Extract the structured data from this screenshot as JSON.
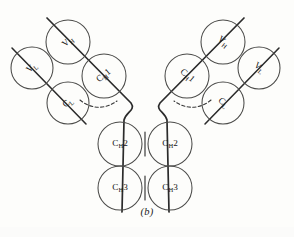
{
  "figure": {
    "caption": "(b)",
    "background_color": "#fdfdfb",
    "stroke_color": "#4a4a48",
    "chain_color": "#2b2b2b",
    "label_color": "#161616",
    "domains": [
      {
        "id": "left-vh",
        "name": "V_H",
        "base": "V",
        "sub": "H",
        "suffix": "",
        "cx": 68,
        "cy": 42,
        "r": 22,
        "rotation": -40,
        "arm": "left"
      },
      {
        "id": "left-vl",
        "name": "V_L",
        "base": "V",
        "sub": "L",
        "suffix": "",
        "cx": 32,
        "cy": 68,
        "r": 21,
        "rotation": -40,
        "arm": "left"
      },
      {
        "id": "left-ch1",
        "name": "C_H1",
        "base": "C",
        "sub": "H",
        "suffix": "1",
        "cx": 104,
        "cy": 76,
        "r": 22,
        "rotation": -40,
        "arm": "left"
      },
      {
        "id": "left-cl",
        "name": "C_L",
        "base": "C",
        "sub": "L",
        "suffix": "",
        "cx": 68,
        "cy": 103,
        "r": 21,
        "rotation": -40,
        "arm": "left"
      },
      {
        "id": "right-vh",
        "name": "V_H",
        "base": "V",
        "sub": "H",
        "suffix": "",
        "cx": 223,
        "cy": 42,
        "r": 22,
        "rotation": 40,
        "arm": "right"
      },
      {
        "id": "right-vl",
        "name": "V_L",
        "base": "V",
        "sub": "L",
        "suffix": "",
        "cx": 259,
        "cy": 68,
        "r": 21,
        "rotation": 40,
        "arm": "right"
      },
      {
        "id": "right-ch1",
        "name": "C_H1",
        "base": "C",
        "sub": "H",
        "suffix": "1",
        "cx": 187,
        "cy": 76,
        "r": 22,
        "rotation": 40,
        "arm": "right"
      },
      {
        "id": "right-cl",
        "name": "C_L",
        "base": "C",
        "sub": "L",
        "suffix": "",
        "cx": 223,
        "cy": 103,
        "r": 21,
        "rotation": 40,
        "arm": "right"
      },
      {
        "id": "left-ch2",
        "name": "C_H2",
        "base": "C",
        "sub": "H",
        "suffix": "2",
        "cx": 120,
        "cy": 144,
        "r": 22,
        "rotation": 0,
        "arm": "stem-left"
      },
      {
        "id": "right-ch2",
        "name": "C_H2",
        "base": "C",
        "sub": "H",
        "suffix": "2",
        "cx": 170,
        "cy": 144,
        "r": 22,
        "rotation": 0,
        "arm": "stem-right"
      },
      {
        "id": "left-ch3",
        "name": "C_H3",
        "base": "C",
        "sub": "H",
        "suffix": "3",
        "cx": 120,
        "cy": 188,
        "r": 22,
        "rotation": 0,
        "arm": "stem-left"
      },
      {
        "id": "right-ch3",
        "name": "C_H3",
        "base": "C",
        "sub": "H",
        "suffix": "3",
        "cx": 170,
        "cy": 188,
        "r": 22,
        "rotation": 0,
        "arm": "stem-right"
      }
    ],
    "heavy_chains": [
      {
        "id": "heavy-left",
        "path": "M 47 18 L 131 103 C 136 110 126 112 124 120 L 122 212"
      },
      {
        "id": "heavy-right",
        "path": "M 244 18 L 160 103 C 155 110 165 112 167 120 L 169 212"
      }
    ],
    "light_chains": [
      {
        "id": "light-left",
        "path": "M 12 48 L 86 124"
      },
      {
        "id": "light-right",
        "path": "M 279 48 L 205 124"
      }
    ],
    "disulfides": [
      {
        "id": "hinge-dash-left",
        "path": "M 80 100 C 92 110 106 109 117 101",
        "style": "dashed"
      },
      {
        "id": "hinge-dash-right",
        "path": "M 211 100 C 199 110 185 109 174 101",
        "style": "dashed"
      },
      {
        "id": "interchain-ch2",
        "path": "M 145 132 L 145 156",
        "style": "solid"
      },
      {
        "id": "interchain-ch3",
        "path": "M 145 176 L 145 200",
        "style": "solid"
      }
    ]
  }
}
